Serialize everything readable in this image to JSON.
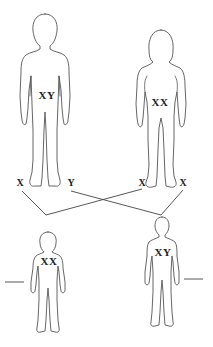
{
  "diagram": {
    "type": "sex-chromosome inheritance cross",
    "parents": {
      "father": {
        "genotype": "XY",
        "gametes": [
          "X",
          "Y"
        ]
      },
      "mother": {
        "genotype": "XX",
        "gametes": [
          "X",
          "X"
        ]
      }
    },
    "offspring": {
      "daughter": {
        "genotype": "XX",
        "blank_label": ""
      },
      "son": {
        "genotype": "XY",
        "blank_label": ""
      }
    },
    "colors": {
      "outline": "#555555",
      "text": "#222222",
      "background": "#ffffff"
    }
  }
}
